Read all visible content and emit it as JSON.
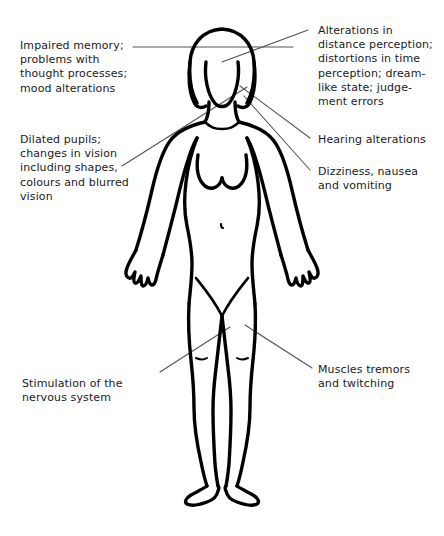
{
  "diagram": {
    "background_color": "#ffffff",
    "outline_color": "#000000",
    "leader_line_color": "#555555",
    "text_color": "#1a1a1a"
  },
  "annotations": {
    "memory": {
      "text": "Impaired memory;\nproblems with\nthought processes;\nmood alterations",
      "side": "left",
      "target": "head"
    },
    "pupils": {
      "text": "Dilated pupils;\nchanges in vision\nincluding shapes,\ncolours and blurred\nvision",
      "side": "left",
      "target": "eyes"
    },
    "nervous": {
      "text": "Stimulation of the\nnervous system",
      "side": "left",
      "target": "left-thigh"
    },
    "perception": {
      "text": "Alterations in\ndistance perception;\ndistortions in time\nperception; dream-\nlike state; judge-\nment errors",
      "side": "right",
      "target": "head"
    },
    "hearing": {
      "text": "Hearing alterations",
      "side": "right",
      "target": "ear"
    },
    "dizziness": {
      "text": "Dizziness, nausea\nand vomiting",
      "side": "right",
      "target": "inner-ear"
    },
    "tremors": {
      "text": "Muscles tremors\nand twitching",
      "side": "right",
      "target": "right-thigh"
    }
  }
}
